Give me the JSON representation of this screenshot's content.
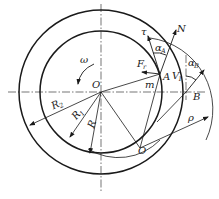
{
  "diagram": {
    "type": "mechanical-geometry",
    "colors": {
      "stroke": "#1a1a1a",
      "background": "#ffffff"
    },
    "labels": {
      "center": "O",
      "omega": "ω",
      "tau": "τ",
      "normal": "N",
      "alpha_A": "α",
      "alpha_A_sub": "A",
      "alpha_B": "α",
      "alpha_B_sub": "B",
      "force": "F",
      "force_sub": "r",
      "point_A": "A",
      "velocity": "V",
      "velocity_sub": "1",
      "point_B": "B",
      "m": "m",
      "R2": "R",
      "R2_sub": "2",
      "R1": "R",
      "R1_sub": "1",
      "R": "R",
      "lower_center": "O",
      "rho": "ρ"
    }
  }
}
